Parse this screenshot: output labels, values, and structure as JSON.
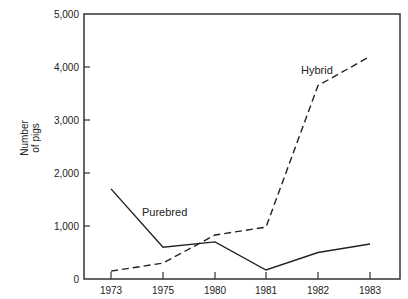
{
  "chart_data": {
    "type": "line",
    "title": "",
    "xlabel": "",
    "ylabel": "Number of pigs",
    "categories": [
      "1973",
      "1975",
      "1980",
      "1981",
      "1982",
      "1983"
    ],
    "series": [
      {
        "name": "Purebred",
        "style": "solid",
        "values": [
          1700,
          600,
          700,
          170,
          500,
          660
        ]
      },
      {
        "name": "Hybrid",
        "style": "dashed",
        "values": [
          150,
          300,
          830,
          980,
          3650,
          4200
        ]
      }
    ],
    "yticks": [
      0,
      1000,
      2000,
      3000,
      4000,
      5000
    ],
    "ytick_labels": [
      "0",
      "1,000",
      "2,000",
      "3,000",
      "4,000",
      "5,000"
    ],
    "ylim": [
      0,
      5000
    ],
    "grid": false,
    "legend": "inline labels"
  },
  "labels": {
    "ylabel_line1": "Number",
    "ylabel_line2": "of pigs",
    "purebred": "Purebred",
    "hybrid": "Hybrid"
  },
  "colors": {
    "line": "#222222",
    "frame": "#333333"
  }
}
